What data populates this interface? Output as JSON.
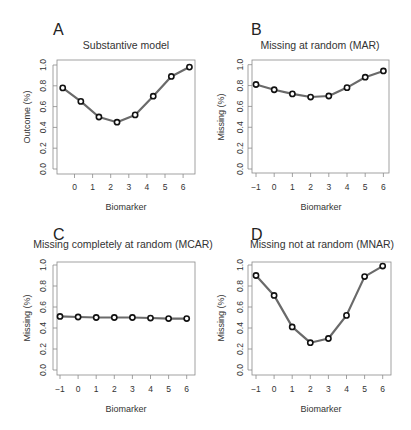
{
  "figure": {
    "panels": [
      {
        "letter": "A",
        "title": "Substantive model",
        "ylabel": "Outcome (%)",
        "xlabel": "Biomarker"
      },
      {
        "letter": "B",
        "title": "Missing at random (MAR)",
        "ylabel": "Missing (%)",
        "xlabel": "Biomarker"
      },
      {
        "letter": "C",
        "title": "Missing completely at random (MCAR)",
        "ylabel": "Missing (%)",
        "xlabel": "Biomarker"
      },
      {
        "letter": "D",
        "title": "Missing not at random (MNAR)",
        "ylabel": "Missing (%)",
        "xlabel": "Biomarker"
      }
    ],
    "colors": {
      "line": "#6a6a6a",
      "marker_stroke": "#111111",
      "marker_fill": "#ffffff",
      "frame": "#8a8a8a",
      "text": "#333333"
    }
  },
  "chart_data": [
    {
      "type": "line",
      "panel": "A",
      "title": "Substantive model",
      "xlabel": "Biomarker",
      "ylabel": "Outcome (%)",
      "x": [
        -0.65,
        0.35,
        1.35,
        2.35,
        3.35,
        4.35,
        5.35,
        6.35
      ],
      "values": [
        0.78,
        0.65,
        0.5,
        0.45,
        0.52,
        0.7,
        0.89,
        0.98
      ],
      "xticks": [
        "0",
        "1",
        "2",
        "3",
        "4",
        "5",
        "6"
      ],
      "yticks": [
        "0.0",
        "0.2",
        "0.4",
        "0.6",
        "0.8",
        "1.0"
      ],
      "ylim": [
        0,
        1
      ],
      "grid": false
    },
    {
      "type": "line",
      "panel": "B",
      "title": "Missing at random (MAR)",
      "xlabel": "Biomarker",
      "ylabel": "Missing (%)",
      "x": [
        -1,
        0,
        1,
        2,
        3,
        4,
        5,
        6
      ],
      "values": [
        0.81,
        0.76,
        0.72,
        0.69,
        0.7,
        0.78,
        0.88,
        0.94
      ],
      "xticks": [
        "-1",
        "0",
        "1",
        "2",
        "3",
        "4",
        "5",
        "6"
      ],
      "yticks": [
        "0.0",
        "0.2",
        "0.4",
        "0.6",
        "0.8",
        "1.0"
      ],
      "ylim": [
        0,
        1
      ],
      "grid": false
    },
    {
      "type": "line",
      "panel": "C",
      "title": "Missing completely at random (MCAR)",
      "xlabel": "Biomarker",
      "ylabel": "Missing (%)",
      "x": [
        -1,
        0,
        1,
        2,
        3,
        4,
        5,
        6
      ],
      "values": [
        0.51,
        0.505,
        0.5,
        0.5,
        0.5,
        0.495,
        0.49,
        0.49
      ],
      "xticks": [
        "-1",
        "0",
        "1",
        "2",
        "3",
        "4",
        "5",
        "6"
      ],
      "yticks": [
        "0.0",
        "0.2",
        "0.4",
        "0.6",
        "0.8",
        "1.0"
      ],
      "ylim": [
        0,
        1
      ],
      "grid": false
    },
    {
      "type": "line",
      "panel": "D",
      "title": "Missing not at random (MNAR)",
      "xlabel": "Biomarker",
      "ylabel": "Missing (%)",
      "x": [
        -1,
        0,
        1,
        2,
        3,
        4,
        5,
        6
      ],
      "values": [
        0.9,
        0.71,
        0.41,
        0.26,
        0.3,
        0.52,
        0.89,
        0.99
      ],
      "xticks": [
        "-1",
        "0",
        "1",
        "2",
        "3",
        "4",
        "5",
        "6"
      ],
      "yticks": [
        "0.0",
        "0.2",
        "0.4",
        "0.6",
        "0.8",
        "1.0"
      ],
      "ylim": [
        0,
        1
      ],
      "grid": false
    }
  ]
}
